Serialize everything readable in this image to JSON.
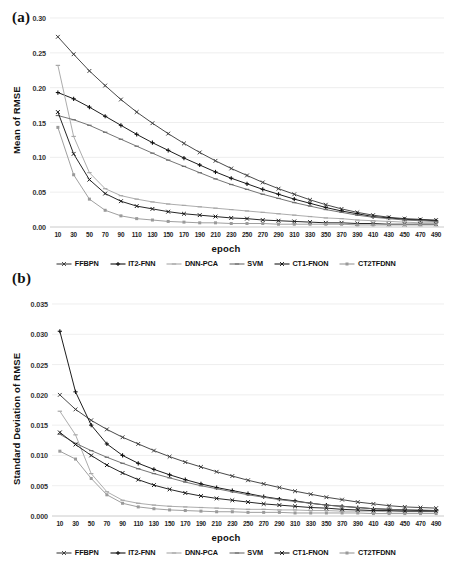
{
  "figure": {
    "panel_a_tag": "(a)",
    "panel_b_tag": "(b)"
  },
  "legend": {
    "position": "bottom",
    "entries": [
      {
        "label": "FFBPN",
        "color": "#3f3f3f",
        "marker": "cross"
      },
      {
        "label": "IT2-FNN",
        "color": "#111111",
        "marker": "plus"
      },
      {
        "label": "DNN-PCA",
        "color": "#a8a8a8",
        "marker": "dash"
      },
      {
        "label": "SVM",
        "color": "#6e6e6e",
        "marker": "dash"
      },
      {
        "label": "CT1-FNON",
        "color": "#1a1a1a",
        "marker": "cross"
      },
      {
        "label": "CT2TFDNN",
        "color": "#9a9a9a",
        "marker": "square"
      }
    ]
  },
  "chart_data": [
    {
      "id": "a",
      "type": "line",
      "title": "",
      "panel": "(a)",
      "xlabel": "epoch",
      "ylabel": "Mean of RMSE",
      "xlim": [
        0,
        500
      ],
      "ylim": [
        0.0,
        0.3
      ],
      "yticks": [
        "0.00",
        "0.05",
        "0.10",
        "0.15",
        "0.20",
        "0.25",
        "0.30"
      ],
      "ytick_values": [
        0.0,
        0.05,
        0.1,
        0.15,
        0.2,
        0.25,
        0.3
      ],
      "grid": true,
      "x": [
        10,
        30,
        50,
        70,
        90,
        110,
        130,
        150,
        170,
        190,
        210,
        230,
        250,
        270,
        290,
        310,
        330,
        350,
        370,
        390,
        410,
        430,
        450,
        470,
        490
      ],
      "xticks": [
        "10",
        "30",
        "50",
        "70",
        "90",
        "110",
        "130",
        "150",
        "170",
        "190",
        "210",
        "230",
        "250",
        "270",
        "290",
        "310",
        "330",
        "350",
        "370",
        "390",
        "410",
        "430",
        "450",
        "470",
        "490"
      ],
      "series": [
        {
          "name": "FFBPN",
          "color": "#3f3f3f",
          "values": [
            0.273,
            0.248,
            0.224,
            0.203,
            0.183,
            0.165,
            0.149,
            0.134,
            0.12,
            0.107,
            0.095,
            0.084,
            0.074,
            0.064,
            0.055,
            0.047,
            0.039,
            0.032,
            0.026,
            0.021,
            0.017,
            0.014,
            0.012,
            0.011,
            0.01
          ]
        },
        {
          "name": "IT2-FNN",
          "color": "#111111",
          "values": [
            0.193,
            0.184,
            0.172,
            0.159,
            0.146,
            0.133,
            0.121,
            0.11,
            0.099,
            0.089,
            0.079,
            0.07,
            0.062,
            0.054,
            0.047,
            0.04,
            0.034,
            0.028,
            0.023,
            0.019,
            0.015,
            0.013,
            0.011,
            0.01,
            0.009
          ]
        },
        {
          "name": "DNN-PCA",
          "color": "#a8a8a8",
          "values": [
            0.232,
            0.13,
            0.078,
            0.055,
            0.045,
            0.04,
            0.036,
            0.033,
            0.031,
            0.029,
            0.027,
            0.025,
            0.023,
            0.021,
            0.019,
            0.017,
            0.015,
            0.013,
            0.012,
            0.01,
            0.009,
            0.008,
            0.007,
            0.006,
            0.006
          ]
        },
        {
          "name": "SVM",
          "color": "#6e6e6e",
          "values": [
            0.16,
            0.154,
            0.146,
            0.136,
            0.126,
            0.116,
            0.106,
            0.096,
            0.087,
            0.078,
            0.069,
            0.061,
            0.054,
            0.047,
            0.041,
            0.035,
            0.03,
            0.025,
            0.021,
            0.017,
            0.014,
            0.012,
            0.01,
            0.009,
            0.008
          ]
        },
        {
          "name": "CT1-FNON",
          "color": "#1a1a1a",
          "values": [
            0.165,
            0.105,
            0.068,
            0.048,
            0.037,
            0.03,
            0.026,
            0.022,
            0.019,
            0.017,
            0.015,
            0.013,
            0.012,
            0.01,
            0.009,
            0.008,
            0.007,
            0.006,
            0.006,
            0.005,
            0.005,
            0.004,
            0.004,
            0.004,
            0.004
          ]
        },
        {
          "name": "CT2TFDNN",
          "color": "#9a9a9a",
          "values": [
            0.143,
            0.075,
            0.04,
            0.024,
            0.016,
            0.012,
            0.01,
            0.008,
            0.007,
            0.006,
            0.006,
            0.005,
            0.005,
            0.005,
            0.004,
            0.004,
            0.004,
            0.004,
            0.004,
            0.003,
            0.003,
            0.003,
            0.003,
            0.003,
            0.003
          ]
        }
      ]
    },
    {
      "id": "b",
      "type": "line",
      "title": "",
      "panel": "(b)",
      "xlabel": "epoch",
      "ylabel": "Standard Deviation of RMSE",
      "xlim": [
        0,
        500
      ],
      "ylim": [
        0.0,
        0.035
      ],
      "yticks": [
        "0.000",
        "0.005",
        "0.010",
        "0.015",
        "0.020",
        "0.025",
        "0.030",
        "0.035"
      ],
      "ytick_values": [
        0.0,
        0.005,
        0.01,
        0.015,
        0.02,
        0.025,
        0.03,
        0.035
      ],
      "grid": true,
      "x": [
        10,
        30,
        50,
        70,
        90,
        110,
        130,
        150,
        170,
        190,
        210,
        230,
        250,
        270,
        290,
        310,
        330,
        350,
        370,
        390,
        410,
        430,
        450,
        470,
        490
      ],
      "xticks": [
        "10",
        "30",
        "50",
        "70",
        "90",
        "110",
        "130",
        "150",
        "170",
        "190",
        "210",
        "230",
        "250",
        "270",
        "290",
        "310",
        "330",
        "350",
        "370",
        "390",
        "410",
        "430",
        "450",
        "470",
        "490"
      ],
      "series": [
        {
          "name": "FFBPN",
          "color": "#3f3f3f",
          "values": [
            0.02,
            0.0176,
            0.0158,
            0.0143,
            0.013,
            0.0119,
            0.0108,
            0.0098,
            0.0089,
            0.0081,
            0.0073,
            0.0066,
            0.0059,
            0.0053,
            0.0047,
            0.0041,
            0.0036,
            0.0031,
            0.0027,
            0.0023,
            0.002,
            0.0017,
            0.0015,
            0.0014,
            0.0013
          ]
        },
        {
          "name": "IT2-FNN",
          "color": "#111111",
          "values": [
            0.0305,
            0.0205,
            0.015,
            0.0119,
            0.01,
            0.0087,
            0.0077,
            0.0068,
            0.006,
            0.0053,
            0.0047,
            0.0042,
            0.0037,
            0.0032,
            0.0028,
            0.0025,
            0.0021,
            0.0018,
            0.0016,
            0.0014,
            0.0012,
            0.0011,
            0.001,
            0.0009,
            0.0009
          ]
        },
        {
          "name": "DNN-PCA",
          "color": "#a8a8a8",
          "values": [
            0.0173,
            0.0134,
            0.007,
            0.004,
            0.0026,
            0.0021,
            0.0018,
            0.0016,
            0.0015,
            0.0014,
            0.0013,
            0.0012,
            0.0011,
            0.0011,
            0.001,
            0.001,
            0.0009,
            0.0009,
            0.0008,
            0.0008,
            0.0008,
            0.0007,
            0.0007,
            0.0007,
            0.0007
          ]
        },
        {
          "name": "SVM",
          "color": "#6e6e6e",
          "values": [
            0.0135,
            0.012,
            0.0108,
            0.0097,
            0.0087,
            0.0078,
            0.007,
            0.0063,
            0.0056,
            0.005,
            0.0045,
            0.004,
            0.0035,
            0.0031,
            0.0027,
            0.0024,
            0.0021,
            0.0018,
            0.0016,
            0.0014,
            0.0012,
            0.0011,
            0.001,
            0.001,
            0.0009
          ]
        },
        {
          "name": "CT1-FNON",
          "color": "#1a1a1a",
          "values": [
            0.0138,
            0.0118,
            0.01,
            0.0084,
            0.0071,
            0.006,
            0.0051,
            0.0044,
            0.0038,
            0.0033,
            0.0029,
            0.0026,
            0.0023,
            0.002,
            0.0018,
            0.0016,
            0.0014,
            0.0013,
            0.0011,
            0.001,
            0.0009,
            0.0009,
            0.0008,
            0.0008,
            0.0008
          ]
        },
        {
          "name": "CT2TFDNN",
          "color": "#9a9a9a",
          "values": [
            0.0107,
            0.0094,
            0.0062,
            0.0035,
            0.0021,
            0.0015,
            0.0012,
            0.001,
            0.0009,
            0.0008,
            0.0007,
            0.0007,
            0.0006,
            0.0006,
            0.0006,
            0.0005,
            0.0005,
            0.0005,
            0.0005,
            0.0005,
            0.0004,
            0.0004,
            0.0004,
            0.0004,
            0.0004
          ]
        }
      ]
    }
  ]
}
